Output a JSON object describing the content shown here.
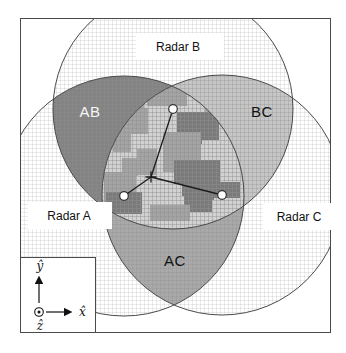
{
  "figure": {
    "radar_labels": {
      "a": "Radar A",
      "b": "Radar B",
      "c": "Radar C"
    },
    "region_labels": {
      "ab": "AB",
      "bc": "BC",
      "ac": "AC"
    },
    "axis_legend": {
      "y": "ŷ",
      "x": "x̂",
      "z": "ẑ"
    }
  },
  "colors": {
    "background": "#ffffff",
    "region_ab": "#838383",
    "region_bc": "#c6c6c6",
    "region_ac": "#a9a9a9",
    "camo_light": "#d2d2d2",
    "camo_medium": "#a4a4a4",
    "camo_dark": "#7a7a7a",
    "outline": "#4a4a4a",
    "grid_line": "#909090",
    "line": "#1c1c1c"
  }
}
